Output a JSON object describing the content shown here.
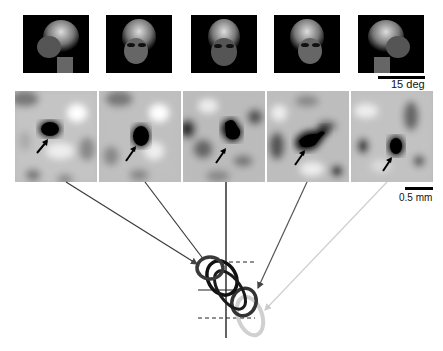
{
  "figure": {
    "faces": [
      {
        "id": "face-1",
        "view": "left profile",
        "x": 23
      },
      {
        "id": "face-2",
        "view": "left three-quarter",
        "x": 106
      },
      {
        "id": "face-3",
        "view": "frontal",
        "x": 191
      },
      {
        "id": "face-4",
        "view": "right three-quarter",
        "x": 274
      },
      {
        "id": "face-5",
        "view": "right profile",
        "x": 358
      }
    ],
    "maps": [
      {
        "id": "map-1",
        "x": 15
      },
      {
        "id": "map-2",
        "x": 99
      },
      {
        "id": "map-3",
        "x": 183
      },
      {
        "id": "map-4",
        "x": 267
      },
      {
        "id": "map-5",
        "x": 351
      }
    ],
    "scale_bars": {
      "angle_label": "15 deg",
      "distance_label": "0.5 mm"
    },
    "colors": {
      "line_dark": "#3a3a3a",
      "line_mid": "#555555",
      "line_light": "#cfcfcf",
      "contour_black": "#111111"
    }
  }
}
